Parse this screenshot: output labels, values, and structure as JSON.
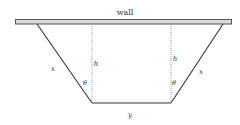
{
  "diagram": {
    "wall_label": "wall",
    "left_side_label": "x",
    "right_side_label": "x",
    "left_height_label": "h",
    "right_height_label": "h",
    "left_angle_label": "θ",
    "right_angle_label": "θ",
    "bottom_label": "y",
    "colors": {
      "wall_fill": "#d8d8d8",
      "wall_stroke": "#555555",
      "line": "#333333",
      "dotted": "#888888"
    }
  }
}
